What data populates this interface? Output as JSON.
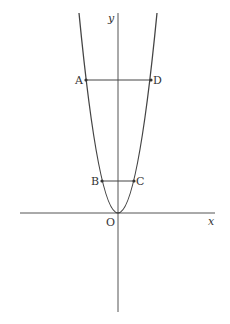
{
  "diagram": {
    "type": "coordinate-plane-parabola",
    "axes": {
      "x_label": "x",
      "y_label": "y",
      "origin_label": "O"
    },
    "curve": {
      "description": "upward-opening parabola with vertex at origin"
    },
    "points": [
      {
        "label": "A",
        "position": "left branch, upper"
      },
      {
        "label": "D",
        "position": "right branch, upper"
      },
      {
        "label": "B",
        "position": "left branch, lower"
      },
      {
        "label": "C",
        "position": "right branch, lower"
      }
    ],
    "segments": [
      {
        "from": "A",
        "to": "D"
      },
      {
        "from": "B",
        "to": "C"
      }
    ],
    "colors": {
      "stroke": "#444444",
      "text": "#333333",
      "background": "#ffffff"
    }
  }
}
